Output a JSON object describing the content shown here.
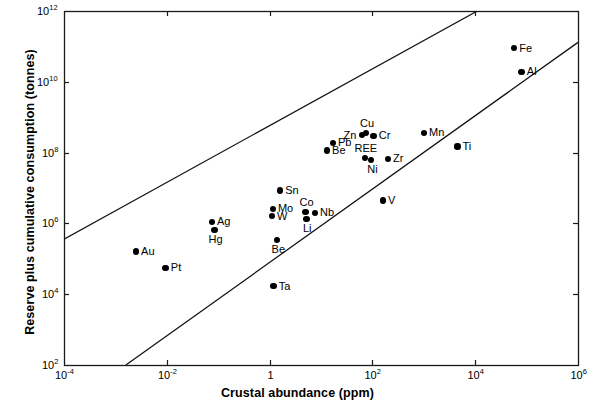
{
  "figure": {
    "background": "#ffffff",
    "ink": "#000000",
    "plot_frame": {
      "left": 64,
      "top": 11,
      "right": 578,
      "bottom": 365
    }
  },
  "chart_data": {
    "type": "scatter",
    "title": "",
    "xlabel": "Crustal abundance (ppm)",
    "ylabel": "Reserve plus cumulative consumption (tonnes)",
    "xscale": "log",
    "yscale": "log",
    "xlim": [
      0.0001,
      1000000.0
    ],
    "ylim": [
      100,
      1000000000000.0
    ],
    "grid": false,
    "legend": false,
    "xticks": [
      {
        "value": 0.0001,
        "label_mantissa": "10",
        "label_exponent": "-4"
      },
      {
        "value": 0.01,
        "label_mantissa": "10",
        "label_exponent": "-2"
      },
      {
        "value": 1,
        "label_mantissa": "1",
        "label_exponent": ""
      },
      {
        "value": 100,
        "label_mantissa": "10",
        "label_exponent": "2"
      },
      {
        "value": 10000,
        "label_mantissa": "10",
        "label_exponent": "4"
      },
      {
        "value": 1000000,
        "label_mantissa": "10",
        "label_exponent": "6"
      }
    ],
    "yticks": [
      {
        "value": 100,
        "label_mantissa": "10",
        "label_exponent": "2"
      },
      {
        "value": 10000,
        "label_mantissa": "10",
        "label_exponent": "4"
      },
      {
        "value": 1000000.0,
        "label_mantissa": "10",
        "label_exponent": "6"
      },
      {
        "value": 100000000.0,
        "label_mantissa": "10",
        "label_exponent": "8"
      },
      {
        "value": 10000000000.0,
        "label_mantissa": "10",
        "label_exponent": "10"
      },
      {
        "value": 1000000000000.0,
        "label_mantissa": "10",
        "label_exponent": "12"
      }
    ],
    "points": [
      {
        "name": "Au",
        "x": 0.0025,
        "y": 160000.0,
        "label_pos": "right"
      },
      {
        "name": "Pt",
        "x": 0.0095,
        "y": 55000.0,
        "label_pos": "right"
      },
      {
        "name": "Ag",
        "x": 0.075,
        "y": 1100000.0,
        "label_pos": "right"
      },
      {
        "name": "Hg",
        "x": 0.085,
        "y": 650000.0,
        "label_pos": "below"
      },
      {
        "name": "W",
        "x": 1.1,
        "y": 1600000.0,
        "label_pos": "right"
      },
      {
        "name": "Mo",
        "x": 1.15,
        "y": 2600000.0,
        "label_pos": "right"
      },
      {
        "name": "Sn",
        "x": 1.6,
        "y": 8500000.0,
        "label_pos": "right"
      },
      {
        "name": "Be",
        "x": 1.4,
        "y": 340000.0,
        "label_pos": "below"
      },
      {
        "name": "Ta",
        "x": 1.2,
        "y": 17000.0,
        "label_pos": "right"
      },
      {
        "name": "Co",
        "x": 5.0,
        "y": 2100000.0,
        "label_pos": "above"
      },
      {
        "name": "Li",
        "x": 5.2,
        "y": 1350000.0,
        "label_pos": "below"
      },
      {
        "name": "Nb",
        "x": 7.6,
        "y": 2000000.0,
        "label_pos": "right"
      },
      {
        "name": "Be",
        "x": 13.0,
        "y": 115000000.0,
        "label_pos": "right"
      },
      {
        "name": "Pb",
        "x": 17.0,
        "y": 190000000.0,
        "label_pos": "right"
      },
      {
        "name": "Zn",
        "x": 62.0,
        "y": 310000000.0,
        "label_pos": "left"
      },
      {
        "name": "Cu",
        "x": 75.0,
        "y": 360000000.0,
        "label_pos": "above"
      },
      {
        "name": "Cr",
        "x": 105.0,
        "y": 300000000.0,
        "label_pos": "right"
      },
      {
        "name": "REE",
        "x": 72.0,
        "y": 70000000.0,
        "label_pos": "above"
      },
      {
        "name": "Ni",
        "x": 95.0,
        "y": 62000000.0,
        "label_pos": "below"
      },
      {
        "name": "Zr",
        "x": 200.0,
        "y": 66000000.0,
        "label_pos": "right"
      },
      {
        "name": "V",
        "x": 160.0,
        "y": 4400000.0,
        "label_pos": "right"
      },
      {
        "name": "Mn",
        "x": 1000.0,
        "y": 360000000.0,
        "label_pos": "right"
      },
      {
        "name": "Ti",
        "x": 4500.0,
        "y": 150000000.0,
        "label_pos": "right"
      },
      {
        "name": "Fe",
        "x": 57000.0,
        "y": 90000000000.0,
        "label_pos": "right"
      },
      {
        "name": "Al",
        "x": 80000.0,
        "y": 19000000000.0,
        "label_pos": "right"
      }
    ],
    "trend_lines": [
      {
        "name": "upper-bound-line",
        "x1": 0.0001,
        "y1": 360000.0,
        "x2": 11000,
        "y2": 1000000000000.0
      },
      {
        "name": "lower-bound-line",
        "x1": 0.0016,
        "y1": 100,
        "x2": 1000000,
        "y2": 130000000000.0
      }
    ]
  }
}
